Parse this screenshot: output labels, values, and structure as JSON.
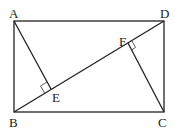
{
  "diagram": {
    "type": "geometry",
    "labels": {
      "A": "A",
      "B": "B",
      "C": "C",
      "D": "D",
      "E": "E",
      "F": "F"
    },
    "points": {
      "A": [
        14,
        21
      ],
      "D": [
        164,
        21
      ],
      "B": [
        14,
        112
      ],
      "C": [
        164,
        112
      ],
      "E": [
        51,
        89
      ],
      "F": [
        128,
        43
      ]
    },
    "right_angles": [
      "E",
      "F"
    ],
    "colors": {
      "stroke": "#222222",
      "background": "#ffffff"
    }
  }
}
